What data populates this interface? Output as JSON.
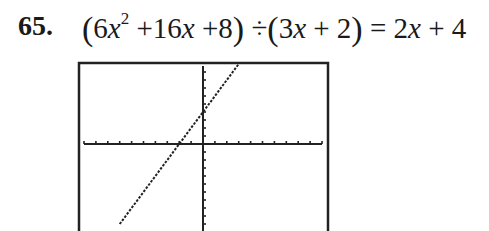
{
  "problem": {
    "number": "65.",
    "equation": {
      "dividend_terms": [
        "6",
        "x",
        "2",
        "+16",
        "x",
        "+8"
      ],
      "divisor": [
        "3",
        "x",
        "+ 2"
      ],
      "result": [
        "2",
        "x",
        "+ 4"
      ],
      "operator": "÷",
      "equals": "="
    },
    "equation_text": "(6x^2 + 16x + 8) ÷ (3x + 2) = 2x + 4"
  },
  "chart_data": {
    "type": "line",
    "title": "",
    "xlabel": "",
    "ylabel": "",
    "function": "y = 2x + 4",
    "x_range": [
      -10,
      10
    ],
    "y_range": [
      -10,
      10
    ],
    "x_ticks": 1,
    "y_ticks": 1,
    "grid": false,
    "series": [
      {
        "name": "y=2x+4",
        "x": [
          -7,
          -2,
          0,
          3
        ],
        "y": [
          -10,
          0,
          4,
          10
        ]
      }
    ],
    "x_intercept": -2,
    "y_intercept": 4,
    "style": "graphing-calculator-dotted"
  }
}
